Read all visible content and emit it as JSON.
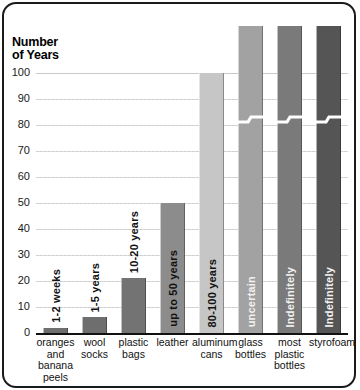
{
  "chart_data": {
    "type": "bar",
    "title": "",
    "ylabel": "Number\nof Years",
    "xlabel": "",
    "ylim": [
      0,
      100
    ],
    "grid": true,
    "legend": "none",
    "yticks": [
      0,
      10,
      20,
      30,
      40,
      50,
      60,
      70,
      80,
      90,
      100
    ],
    "ytick_labels": [
      "0",
      "10",
      "20",
      "30",
      "40",
      "50",
      "60",
      "70",
      "80",
      "90",
      "100"
    ],
    "categories": [
      "oranges\nand\nbanana\npeels",
      "wool\nsocks",
      "plastic\nbags",
      "leather",
      "aluminum\ncans",
      "glass\nbottles",
      "most\nplastic\nbottles",
      "styrofoam"
    ],
    "values": [
      2,
      6,
      21,
      50,
      100,
      118,
      118,
      118
    ],
    "bar_labels": [
      "1-2 weeks",
      "1-5 years",
      "10-20 years",
      "up to 50 years",
      "80-100 years",
      "uncertain",
      "Indefinitely",
      "Indefinitely"
    ],
    "bar_colors": [
      "#6e6e6e",
      "#6e6e6e",
      "#737373",
      "#8c8c8c",
      "#c6c6c6",
      "#a2a2a2",
      "#7a7a7a",
      "#555555"
    ],
    "axis_broken": [
      false,
      false,
      false,
      false,
      false,
      true,
      true,
      true
    ],
    "label_placement": [
      "above",
      "above",
      "above",
      "inside",
      "inside",
      "inside",
      "inside",
      "inside"
    ]
  }
}
